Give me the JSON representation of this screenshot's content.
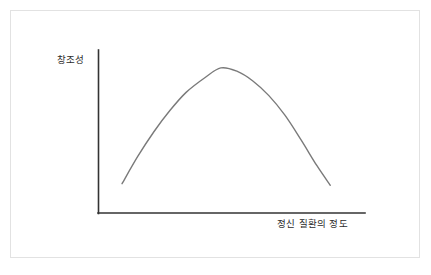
{
  "figure": {
    "background_color": "#ffffff",
    "border_color": "#e2e2e2",
    "axis_color": "#333333",
    "curve_color": "#7a7a7a"
  },
  "chart_data": {
    "type": "line",
    "title": "",
    "subtitle": "",
    "xlabel": "정신 질환의 정도",
    "ylabel": "창조성",
    "grid": false,
    "legend": null,
    "annotations": [],
    "xlim": [
      0,
      1
    ],
    "ylim": [
      0,
      1
    ],
    "xticks": [],
    "yticks": [],
    "xticklabels": [],
    "yticklabels": [],
    "series": [
      {
        "name": "창조성",
        "color": "#7a7a7a",
        "x": [
          0.09,
          0.15,
          0.21,
          0.27,
          0.33,
          0.4,
          0.46,
          0.52,
          0.58,
          0.64,
          0.7,
          0.76,
          0.82,
          0.87
        ],
        "y": [
          0.18,
          0.35,
          0.5,
          0.63,
          0.74,
          0.83,
          0.89,
          0.87,
          0.81,
          0.72,
          0.6,
          0.45,
          0.29,
          0.17
        ]
      }
    ]
  }
}
